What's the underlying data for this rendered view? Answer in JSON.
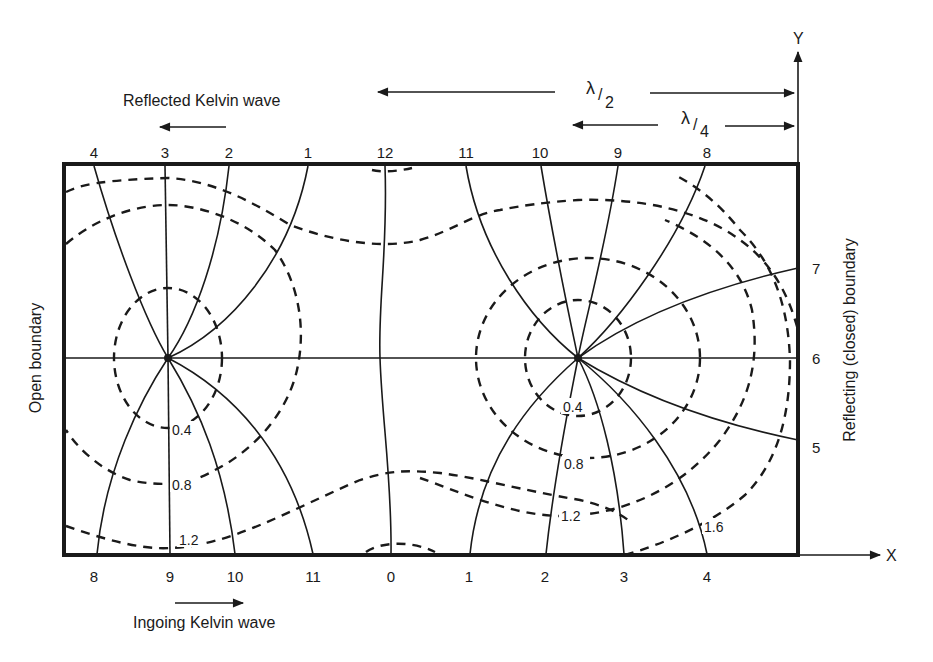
{
  "figure": {
    "type": "amphidromic-system-diagram",
    "colors": {
      "ink": "#1a1a1a",
      "background": "#ffffff"
    }
  },
  "axes": {
    "x_label": "X",
    "y_label": "Y"
  },
  "annotations": {
    "reflected_wave": "Reflected Kelvin wave",
    "ingoing_wave": "Ingoing Kelvin wave",
    "half_wavelength": {
      "symbol": "λ",
      "denominator": "2"
    },
    "quarter_wavelength": {
      "symbol": "λ",
      "denominator": "4"
    },
    "left_boundary": "Open boundary",
    "right_boundary": "Reflecting (closed) boundary"
  },
  "cotidal_labels": {
    "top": [
      "4",
      "3",
      "2",
      "1",
      "12",
      "11",
      "10",
      "9",
      "8"
    ],
    "bottom": [
      "8",
      "9",
      "10",
      "11",
      "0",
      "1",
      "2",
      "3",
      "4"
    ],
    "right": [
      "7",
      "6",
      "5"
    ]
  },
  "corange_labels": {
    "left_amphidrome": [
      "0.4",
      "0.8",
      "1.2"
    ],
    "right_amphidrome": [
      "0.4",
      "0.8",
      "1.2",
      "1.6"
    ]
  },
  "amphidromic_points": [
    {
      "name": "left",
      "x": 168,
      "y": 358
    },
    {
      "name": "right",
      "x": 578,
      "y": 358
    }
  ]
}
